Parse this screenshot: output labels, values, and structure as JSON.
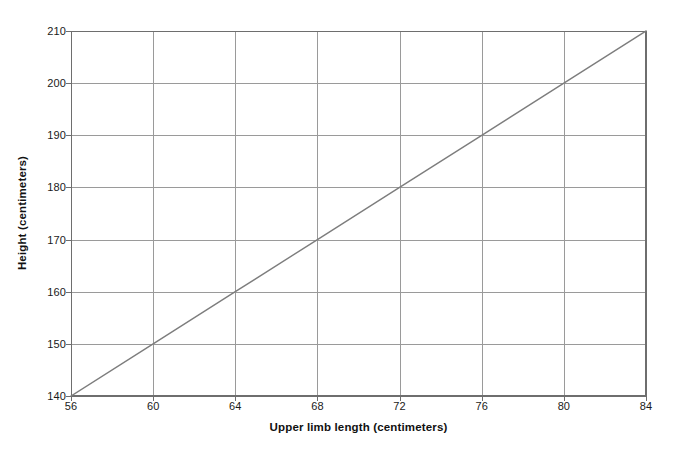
{
  "chart_data": {
    "type": "line",
    "title": "",
    "subtitle": "",
    "xlabel": "Upper limb length (centimeters)",
    "ylabel": "Height (centimeters)",
    "xlim": [
      56,
      84
    ],
    "ylim": [
      140,
      210
    ],
    "xticks": [
      56,
      60,
      64,
      68,
      72,
      76,
      80,
      84
    ],
    "yticks": [
      140,
      150,
      160,
      170,
      180,
      190,
      200,
      210
    ],
    "xtick_labels": [
      "56",
      "60",
      "64",
      "68",
      "72",
      "76",
      "80",
      "84"
    ],
    "ytick_labels": [
      "140",
      "150",
      "160",
      "170",
      "180",
      "190",
      "200",
      "210"
    ],
    "grid": true,
    "legend": null,
    "legend_position": "none",
    "annotations": [],
    "series": [
      {
        "name": "height-vs-upper-limb-length",
        "x": [
          56,
          60,
          64,
          68,
          72,
          76,
          80,
          84
        ],
        "values": [
          140,
          150,
          160,
          170,
          180,
          190,
          200,
          210
        ],
        "color": "#7d7d7d",
        "style": "solid",
        "markers": false,
        "slope": 2.5,
        "intercept": 0
      }
    ]
  },
  "figure": {
    "background_color": "#ffffff",
    "grid_color": "#9a9a9a",
    "axis_color": "#6e6e6e",
    "line_color": "#7d7d7d",
    "text_color": "#1a1a1a"
  }
}
